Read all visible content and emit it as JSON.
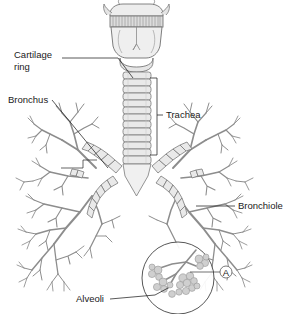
{
  "figure": {
    "background_color": "#ffffff",
    "line_color": "#6e6e6e",
    "label_color": "#1a1a1a",
    "fill_color": "#e8e8e8"
  },
  "labels": {
    "cartilage_ring_line1": "Cartilage",
    "cartilage_ring_line2": "ring",
    "bronchus": "Bronchus",
    "trachea": "Trachea",
    "bronchiole": "Bronchiole",
    "alveoli": "Alveoli",
    "inset_marker": "A"
  }
}
